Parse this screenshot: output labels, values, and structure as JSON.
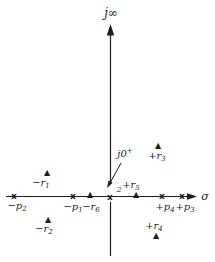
{
  "figure": {
    "type": "s-plane pole-zero plot",
    "background": "#ffffff",
    "ink": "#1c1c1c",
    "pole_glyph": "x",
    "zero_glyph": "▲"
  },
  "axes": {
    "imaginary_label": "j∞",
    "real_label": "σ",
    "origin_annotation": {
      "text": "j0",
      "sup": "+"
    },
    "origin_pole_multiplicity": "2"
  },
  "poles": [
    {
      "name": "-p2",
      "location": "negative-real-axis",
      "label": {
        "text": "−p",
        "sub": "2"
      }
    },
    {
      "name": "-p1",
      "location": "negative-real-axis",
      "label": {
        "text": "−p",
        "sub": "1"
      }
    },
    {
      "name": "origin",
      "location": "origin",
      "multiplicity": 2
    },
    {
      "name": "+p4",
      "location": "positive-real-axis",
      "label": {
        "text": "+p",
        "sub": "4"
      }
    },
    {
      "name": "+p3",
      "location": "positive-real-axis",
      "label": {
        "text": "+p",
        "sub": "3"
      }
    }
  ],
  "zeros": [
    {
      "name": "-r1",
      "location": "upper-left-quadrant",
      "label": {
        "text": "−r",
        "sub": "1"
      }
    },
    {
      "name": "-r2",
      "location": "lower-left-quadrant",
      "label": {
        "text": "−r",
        "sub": "2"
      }
    },
    {
      "name": "-r6",
      "location": "negative-real-axis",
      "label": {
        "text": "−r",
        "sub": "6"
      }
    },
    {
      "name": "+r5",
      "location": "positive-real-axis",
      "label": {
        "text": "+r",
        "sub": "5"
      }
    },
    {
      "name": "+r3",
      "location": "upper-right-quadrant",
      "label": {
        "text": "+r",
        "sub": "3"
      }
    },
    {
      "name": "+r4",
      "location": "lower-right-quadrant",
      "label": {
        "text": "+r",
        "sub": "4"
      }
    }
  ]
}
